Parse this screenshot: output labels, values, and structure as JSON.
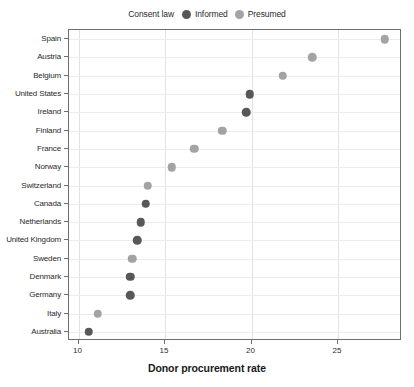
{
  "chart_data": {
    "type": "scatter",
    "title": "",
    "xlabel": "Donor procurement rate",
    "ylabel": "",
    "xlim": [
      9.45,
      28.7
    ],
    "xticks": [
      10,
      15,
      20,
      25
    ],
    "xtick_labels": [
      "10",
      "15",
      "20",
      "25"
    ],
    "grid": true,
    "legend_position": "top-center",
    "legend_title": "Consent law",
    "series": [
      {
        "name": "Informed",
        "color": "#585858"
      },
      {
        "name": "Presumed",
        "color": "#a3a3a3"
      }
    ],
    "categories": [
      "Spain",
      "Austria",
      "Belgium",
      "United States",
      "Ireland",
      "Finland",
      "France",
      "Norway",
      "Switzerland",
      "Canada",
      "Netherlands",
      "United Kingdom",
      "Sweden",
      "Denmark",
      "Germany",
      "Italy",
      "Australia"
    ],
    "points": [
      {
        "country": "Spain",
        "value": 27.7,
        "consent_law": "Presumed"
      },
      {
        "country": "Austria",
        "value": 23.5,
        "consent_law": "Presumed"
      },
      {
        "country": "Belgium",
        "value": 21.8,
        "consent_law": "Presumed"
      },
      {
        "country": "United States",
        "value": 19.9,
        "consent_law": "Informed"
      },
      {
        "country": "Ireland",
        "value": 19.7,
        "consent_law": "Informed"
      },
      {
        "country": "Finland",
        "value": 18.3,
        "consent_law": "Presumed"
      },
      {
        "country": "France",
        "value": 16.7,
        "consent_law": "Presumed"
      },
      {
        "country": "Norway",
        "value": 15.4,
        "consent_law": "Presumed"
      },
      {
        "country": "Switzerland",
        "value": 14.0,
        "consent_law": "Presumed"
      },
      {
        "country": "Canada",
        "value": 13.9,
        "consent_law": "Informed"
      },
      {
        "country": "Netherlands",
        "value": 13.6,
        "consent_law": "Informed"
      },
      {
        "country": "United Kingdom",
        "value": 13.4,
        "consent_law": "Informed"
      },
      {
        "country": "Sweden",
        "value": 13.1,
        "consent_law": "Presumed"
      },
      {
        "country": "Denmark",
        "value": 13.0,
        "consent_law": "Informed"
      },
      {
        "country": "Germany",
        "value": 13.0,
        "consent_law": "Informed"
      },
      {
        "country": "Italy",
        "value": 11.1,
        "consent_law": "Presumed"
      },
      {
        "country": "Australia",
        "value": 10.6,
        "consent_law": "Informed"
      }
    ]
  },
  "legend": {
    "title": "Consent law",
    "items": [
      {
        "label": "Informed",
        "color": "#585858"
      },
      {
        "label": "Presumed",
        "color": "#a3a3a3"
      }
    ]
  },
  "axis": {
    "x_title": "Donor procurement rate"
  },
  "colors": {
    "informed": "#585858",
    "presumed": "#a3a3a3",
    "axis": "#6e6e6e",
    "grid_vertical": "#e2e2e2",
    "grid_horizontal": "#ececec",
    "text": "#2b2b2b",
    "background": "#ffffff"
  }
}
